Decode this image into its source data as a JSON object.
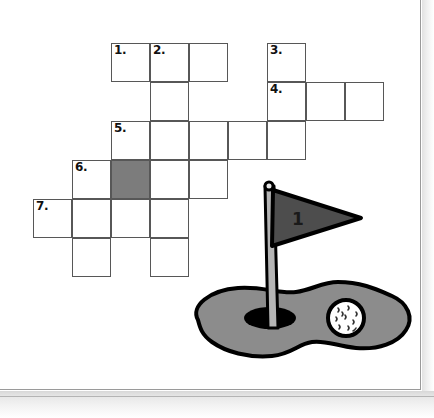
{
  "page": {
    "type": "worksheet-scan",
    "background_color": "#ffffff",
    "sheet_border_color": "#9a9a9a"
  },
  "crossword": {
    "name": "golf-crossword-grid",
    "cell_size": 39,
    "origin_x": 33,
    "origin_y": 43,
    "grid_line_color": "#575757",
    "cell_fill_color": "#ffffff",
    "shaded_fill_color": "#7c7c7c",
    "number_color": "#111111",
    "clue_numbers": [
      "1.",
      "2.",
      "3.",
      "4.",
      "5.",
      "6.",
      "7."
    ],
    "entries": [
      {
        "number": "1.",
        "direction": "across",
        "row": 0,
        "col": 2,
        "length": 3,
        "numbered_cell": {
          "row": 0,
          "col": 2
        }
      },
      {
        "number": "2.",
        "direction": "down",
        "row": 0,
        "col": 3,
        "length": 6,
        "numbered_cell": {
          "row": 0,
          "col": 3
        }
      },
      {
        "number": "3.",
        "direction": "down",
        "row": 0,
        "col": 6,
        "length": 3,
        "numbered_cell": {
          "row": 0,
          "col": 6
        }
      },
      {
        "number": "4.",
        "direction": "across",
        "row": 1,
        "col": 6,
        "length": 3,
        "numbered_cell": {
          "row": 1,
          "col": 6
        }
      },
      {
        "number": "5.",
        "direction": "across",
        "row": 2,
        "col": 2,
        "length": 5,
        "numbered_cell": {
          "row": 2,
          "col": 2
        }
      },
      {
        "number": "6.",
        "direction": "across",
        "row": 3,
        "col": 1,
        "length": 4,
        "numbered_cell": {
          "row": 3,
          "col": 1
        }
      },
      {
        "number": "7.",
        "direction": "across",
        "row": 4,
        "col": 0,
        "length": 4,
        "numbered_cell": {
          "row": 4,
          "col": 0
        }
      }
    ],
    "cells": [
      {
        "row": 0,
        "col": 2,
        "number": "1.",
        "shaded": false
      },
      {
        "row": 0,
        "col": 3,
        "number": "2.",
        "shaded": false
      },
      {
        "row": 0,
        "col": 4,
        "number": "",
        "shaded": false
      },
      {
        "row": 0,
        "col": 6,
        "number": "3.",
        "shaded": false
      },
      {
        "row": 1,
        "col": 3,
        "number": "",
        "shaded": false
      },
      {
        "row": 1,
        "col": 6,
        "number": "4.",
        "shaded": false
      },
      {
        "row": 1,
        "col": 7,
        "number": "",
        "shaded": false
      },
      {
        "row": 1,
        "col": 8,
        "number": "",
        "shaded": false
      },
      {
        "row": 2,
        "col": 2,
        "number": "5.",
        "shaded": false
      },
      {
        "row": 2,
        "col": 3,
        "number": "",
        "shaded": false
      },
      {
        "row": 2,
        "col": 4,
        "number": "",
        "shaded": false
      },
      {
        "row": 2,
        "col": 5,
        "number": "",
        "shaded": false
      },
      {
        "row": 2,
        "col": 6,
        "number": "",
        "shaded": false
      },
      {
        "row": 3,
        "col": 1,
        "number": "6.",
        "shaded": false
      },
      {
        "row": 3,
        "col": 2,
        "number": "",
        "shaded": true
      },
      {
        "row": 3,
        "col": 3,
        "number": "",
        "shaded": false
      },
      {
        "row": 3,
        "col": 4,
        "number": "",
        "shaded": false
      },
      {
        "row": 4,
        "col": 0,
        "number": "7.",
        "shaded": false
      },
      {
        "row": 4,
        "col": 1,
        "number": "",
        "shaded": false
      },
      {
        "row": 4,
        "col": 2,
        "number": "",
        "shaded": false
      },
      {
        "row": 4,
        "col": 3,
        "number": "",
        "shaded": false
      },
      {
        "row": 5,
        "col": 1,
        "number": "",
        "shaded": false
      },
      {
        "row": 5,
        "col": 3,
        "number": "",
        "shaded": false
      }
    ]
  },
  "illustration": {
    "name": "golf-green-with-flag",
    "flag_number": "1",
    "colors": {
      "green_fill": "#8c8c8c",
      "green_outline": "#000000",
      "flag_fill": "#4d4d4d",
      "flag_outline": "#000000",
      "pole_fill": "#b5b5b5",
      "pole_outline": "#000000",
      "hole_fill": "#000000",
      "ball_fill": "#ffffff",
      "ball_outline": "#000000",
      "flag_number_color": "#1a1a1a"
    },
    "parts": [
      {
        "name": "putting-green",
        "shape": "blob"
      },
      {
        "name": "golf-hole",
        "shape": "ellipse"
      },
      {
        "name": "flag-pole",
        "shape": "tapered-bar"
      },
      {
        "name": "flag-pennant",
        "shape": "right-pointing-triangle"
      },
      {
        "name": "golf-ball",
        "shape": "dimpled-circle"
      }
    ]
  }
}
